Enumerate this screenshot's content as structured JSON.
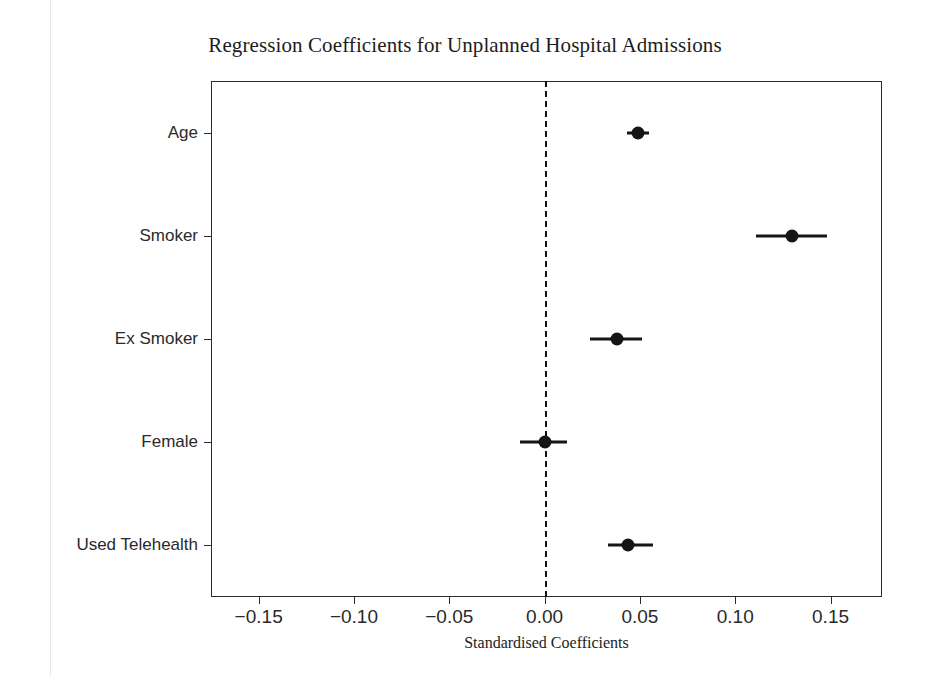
{
  "chart_data": {
    "type": "scatter",
    "subtype": "forest-plot",
    "title": "Regression Coefficients for Unplanned Hospital Admissions",
    "xlabel": "Standardised Coefficients",
    "ylabel": "",
    "xlim": [
      -0.175,
      0.177
    ],
    "xticks": [
      -0.15,
      -0.1,
      -0.05,
      0.0,
      0.05,
      0.1,
      0.15
    ],
    "xticklabels": [
      "−0.15",
      "−0.10",
      "−0.05",
      "0.00",
      "0.05",
      "0.10",
      "0.15"
    ],
    "grid": false,
    "legend": null,
    "reference_line": {
      "value": 0.0,
      "orientation": "vertical",
      "style": "dashed",
      "color": "#111111"
    },
    "categories": [
      "Age",
      "Smoker",
      "Ex Smoker",
      "Female",
      "Used Telehealth"
    ],
    "values": [
      0.049,
      0.13,
      0.038,
      0.0,
      0.044
    ],
    "ci_low": [
      0.043,
      0.111,
      0.024,
      -0.013,
      0.033
    ],
    "ci_high": [
      0.055,
      0.148,
      0.051,
      0.012,
      0.057
    ],
    "marker_color": "#151515",
    "points": [
      {
        "label": "Age",
        "value": 0.049,
        "ci_low": 0.043,
        "ci_high": 0.055
      },
      {
        "label": "Smoker",
        "value": 0.13,
        "ci_low": 0.111,
        "ci_high": 0.148
      },
      {
        "label": "Ex Smoker",
        "value": 0.038,
        "ci_low": 0.024,
        "ci_high": 0.051
      },
      {
        "label": "Female",
        "value": 0.0,
        "ci_low": -0.013,
        "ci_high": 0.012
      },
      {
        "label": "Used Telehealth",
        "value": 0.044,
        "ci_low": 0.033,
        "ci_high": 0.057
      }
    ]
  },
  "figure": {
    "title": "Regression Coefficients for Unplanned Hospital Admissions",
    "xaxis_title": "Standardised Coefficients",
    "background_color": "#ffffff",
    "frame_color": "#2b2b2b"
  }
}
